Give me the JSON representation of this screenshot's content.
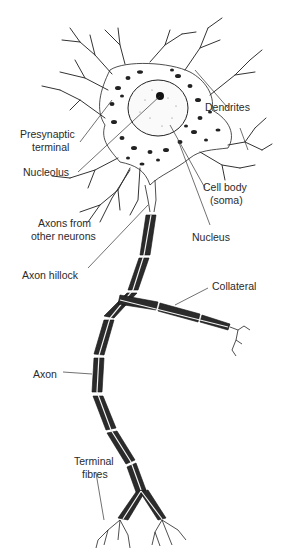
{
  "figure": {
    "labels": {
      "dendrites": "Dendrites",
      "presynaptic_terminal_1": "Presynaptic",
      "presynaptic_terminal_2": "terminal",
      "nucleolus": "Nucleolus",
      "cell_body_1": "Cell body",
      "cell_body_2": "(soma)",
      "axons_from_other_1": "Axons from",
      "axons_from_other_2": "other neurons",
      "nucleus": "Nucleus",
      "axon_hillock": "Axon hillock",
      "collateral": "Collateral",
      "axon": "Axon",
      "terminal_fibres_1": "Terminal",
      "terminal_fibres_2": "fibres"
    },
    "colors": {
      "ink": "#222222",
      "background": "#ffffff",
      "myelin": "#2b2b2b"
    }
  }
}
